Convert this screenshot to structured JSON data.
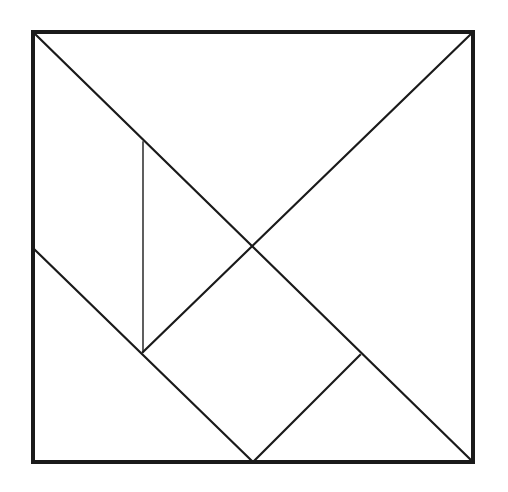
{
  "figure": {
    "type": "geometric-diagram",
    "background_color": "#ffffff",
    "stroke_color": "#1a1a1a",
    "fill_color": "#ffffff",
    "frame_stroke_width": 4,
    "cut_stroke_width": 2.2,
    "thin_cut_stroke_width": 1.4,
    "canvas": {
      "width": 508,
      "height": 492
    }
  },
  "square": {
    "label": "outer-square",
    "left": 33,
    "top": 32,
    "right": 473,
    "bottom": 462,
    "width": 440,
    "height": 430,
    "corners": {
      "top_left": [
        33,
        32
      ],
      "top_right": [
        473,
        32
      ],
      "bottom_right": [
        473,
        462
      ],
      "bottom_left": [
        33,
        462
      ]
    },
    "path": "M 33 32 L 473 32 L 473 462 L 33 462 Z"
  },
  "points": {
    "A_top_left": [
      33,
      32
    ],
    "B_top_right": [
      473,
      32
    ],
    "C_bottom_right": [
      473,
      462
    ],
    "D_bottom_left": [
      33,
      462
    ],
    "E_left_mid": [
      33,
      248
    ],
    "F_bottom_mid": [
      253,
      462
    ],
    "G_center": [
      253,
      244
    ],
    "H_quarter_diag": [
      143,
      352
    ],
    "I_vertical_top": [
      143,
      142
    ],
    "J_tee": [
      360,
      355
    ]
  },
  "cuts": [
    {
      "name": "main-diagonal",
      "from": "A_top_left",
      "to": "C_bottom_right",
      "path": "M 33 32 L 473 462",
      "weight": "normal"
    },
    {
      "name": "anti-diagonal",
      "from": "B_top_right",
      "to": "H_quarter_diag",
      "path": "M 473 32 L 143 352",
      "weight": "normal"
    },
    {
      "name": "left-edge-to-bottom-mid",
      "from": "E_left_mid",
      "to": "F_bottom_mid",
      "path": "M 33 248 L 253 462",
      "weight": "normal"
    },
    {
      "name": "vertical-cut",
      "from": "I_vertical_top",
      "to": "H_quarter_diag",
      "path": "M 143 142 L 143 352",
      "weight": "thin"
    },
    {
      "name": "short-cut-to-bottom-mid",
      "from": "J_tee",
      "to": "F_bottom_mid",
      "path": "M 360 355 L 253 462",
      "weight": "normal"
    }
  ],
  "pieces": [
    {
      "name": "large-triangle-upper",
      "shape": "right-triangle",
      "size": "large",
      "path": "M 33 32 L 473 32 L 253 244 Z"
    },
    {
      "name": "large-triangle-right",
      "shape": "right-triangle",
      "size": "large",
      "path": "M 473 32 L 473 462 L 253 244 Z"
    },
    {
      "name": "medium-triangle",
      "shape": "right-triangle",
      "size": "medium",
      "path": "M 33 32 L 143 142 L 143 352 Z"
    },
    {
      "name": "small-triangle-left",
      "shape": "right-triangle",
      "size": "small",
      "path": "M 33 248 L 143 352 L 33 462 Z"
    },
    {
      "name": "small-triangle-lower",
      "shape": "right-triangle",
      "size": "small",
      "path": "M 143 352 L 253 244 L 253 462 Z"
    },
    {
      "name": "square-piece",
      "shape": "square",
      "size": "small",
      "path": "M 253 244 L 360 355 L 253 462 Z"
    },
    {
      "name": "parallelogram-piece",
      "shape": "parallelogram",
      "size": "small",
      "path": "M 360 355 L 473 462 L 253 462 Z"
    }
  ]
}
